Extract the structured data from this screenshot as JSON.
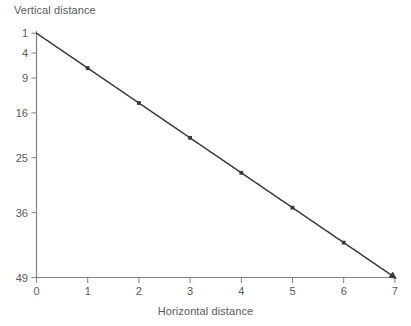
{
  "chart_data": {
    "type": "line",
    "title": "",
    "subtitle": "",
    "xlabel": "Horizontal distance",
    "ylabel": "Vertical distance",
    "x": [
      0,
      1,
      2,
      3,
      4,
      5,
      6,
      7
    ],
    "values": [
      0,
      1,
      4,
      9,
      16,
      25,
      36,
      49
    ],
    "series": [
      {
        "name": "trajectory",
        "x": [
          0,
          1,
          2,
          3,
          4,
          5,
          6,
          7
        ],
        "values": [
          0,
          1,
          4,
          9,
          16,
          25,
          36,
          49
        ]
      }
    ],
    "xlim": [
      0,
      7
    ],
    "ylim": [
      0,
      49
    ],
    "y_axis_inverted": true,
    "y_axis_scale": "sqrt",
    "xticks": [
      0,
      1,
      2,
      3,
      4,
      5,
      6,
      7
    ],
    "xticklabels": [
      "0",
      "1",
      "2",
      "3",
      "4",
      "5",
      "6",
      "7"
    ],
    "yticks": [
      1,
      4,
      9,
      16,
      25,
      36,
      49
    ],
    "yticklabels": [
      "1",
      "4",
      "9",
      "16",
      "25",
      "36",
      "49"
    ],
    "grid": false,
    "legend": null,
    "markers": "small square points at each integer horizontal distance",
    "annotations": [
      "arrowhead at the end of the curve at (7, 49)"
    ],
    "line_color": "#3a3a3a",
    "axis_color": "#808285",
    "text_color": "#59595b",
    "background_color": "#ffffff"
  },
  "axes": {
    "y_title": "Vertical distance",
    "x_title": "Horizontal distance",
    "y_ticks": [
      {
        "label": "1",
        "value": 1
      },
      {
        "label": "4",
        "value": 4
      },
      {
        "label": "9",
        "value": 9
      },
      {
        "label": "16",
        "value": 16
      },
      {
        "label": "25",
        "value": 25
      },
      {
        "label": "36",
        "value": 36
      },
      {
        "label": "49",
        "value": 49
      }
    ],
    "x_ticks": [
      {
        "label": "0",
        "value": 0
      },
      {
        "label": "1",
        "value": 1
      },
      {
        "label": "2",
        "value": 2
      },
      {
        "label": "3",
        "value": 3
      },
      {
        "label": "4",
        "value": 4
      },
      {
        "label": "5",
        "value": 5
      },
      {
        "label": "6",
        "value": 6
      },
      {
        "label": "7",
        "value": 7
      }
    ]
  }
}
